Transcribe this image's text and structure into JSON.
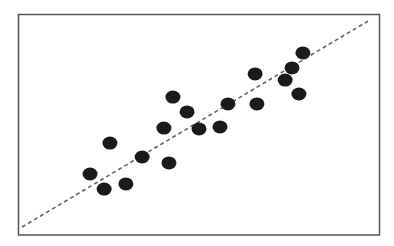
{
  "chart_data": {
    "type": "scatter",
    "title": "",
    "xlabel": "",
    "ylabel": "",
    "xlim": [
      0,
      10
    ],
    "ylim": [
      0,
      10
    ],
    "grid": false,
    "legend": null,
    "axis_ticks": false,
    "frame": true,
    "series": [
      {
        "name": "points",
        "marker": "filled-ellipse",
        "color": "#1a1a1a",
        "x": [
          1.99,
          2.38,
          2.54,
          2.98,
          3.43,
          4.03,
          4.17,
          4.28,
          4.67,
          5.0,
          5.58,
          5.8,
          6.55,
          6.6,
          7.38,
          7.57,
          7.76,
          7.87
        ],
        "y": [
          2.76,
          2.08,
          4.16,
          2.31,
          3.53,
          4.84,
          3.26,
          6.24,
          5.57,
          4.8,
          4.89,
          5.93,
          7.29,
          5.93,
          7.01,
          7.56,
          6.38,
          8.24
        ]
      }
    ],
    "trend_line": {
      "style": "dashed",
      "color": "#666666",
      "x": [
        0.11,
        9.67
      ],
      "y": [
        0.36,
        9.68
      ]
    }
  },
  "colors": {
    "frame": "#555555",
    "points": "#1a1a1a",
    "trend_line": "#666666",
    "background": "#ffffff"
  }
}
